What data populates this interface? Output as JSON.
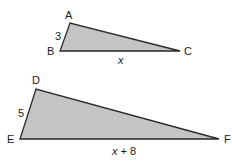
{
  "diagram": {
    "type": "similar-triangles",
    "colors": {
      "fill": "#c4c4c4",
      "stroke": "#2a2a2a",
      "text": "#1a1a1a"
    },
    "triangles": [
      {
        "name": "ABC",
        "vertices": {
          "A": {
            "label": "A",
            "x": 70,
            "y": 23
          },
          "B": {
            "label": "B",
            "x": 60,
            "y": 51
          },
          "C": {
            "label": "C",
            "x": 180,
            "y": 51
          }
        },
        "sides": {
          "AB": "3",
          "BC": "x"
        }
      },
      {
        "name": "DEF",
        "vertices": {
          "D": {
            "label": "D",
            "x": 36,
            "y": 89
          },
          "E": {
            "label": "E",
            "x": 20,
            "y": 139
          },
          "F": {
            "label": "F",
            "x": 219,
            "y": 139
          }
        },
        "sides": {
          "DE": "5",
          "EF_var": "x",
          "EF_rest": " + 8"
        }
      }
    ]
  }
}
